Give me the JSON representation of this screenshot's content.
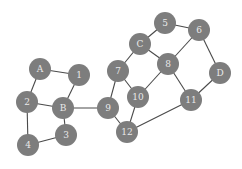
{
  "graph": {
    "node_radius": 11,
    "node_color": "#7d7d7d",
    "edge_color": "#4a4a4a",
    "label_color": "#e9e9e9",
    "nodes": [
      {
        "id": "A",
        "label": "A",
        "x": 40,
        "y": 69
      },
      {
        "id": "1",
        "label": "1",
        "x": 79,
        "y": 75
      },
      {
        "id": "2",
        "label": "2",
        "x": 27,
        "y": 102
      },
      {
        "id": "B",
        "label": "B",
        "x": 63,
        "y": 108
      },
      {
        "id": "3",
        "label": "3",
        "x": 66,
        "y": 135
      },
      {
        "id": "4",
        "label": "4",
        "x": 28,
        "y": 145
      },
      {
        "id": "7",
        "label": "7",
        "x": 118,
        "y": 71
      },
      {
        "id": "9",
        "label": "9",
        "x": 108,
        "y": 108
      },
      {
        "id": "10",
        "label": "10",
        "x": 138,
        "y": 97
      },
      {
        "id": "12",
        "label": "12",
        "x": 127,
        "y": 132
      },
      {
        "id": "C",
        "label": "C",
        "x": 140,
        "y": 44
      },
      {
        "id": "5",
        "label": "5",
        "x": 165,
        "y": 23
      },
      {
        "id": "6",
        "label": "6",
        "x": 199,
        "y": 30
      },
      {
        "id": "8",
        "label": "8",
        "x": 168,
        "y": 64
      },
      {
        "id": "D",
        "label": "D",
        "x": 220,
        "y": 73
      },
      {
        "id": "11",
        "label": "11",
        "x": 191,
        "y": 100
      }
    ],
    "edges": [
      [
        "A",
        "1"
      ],
      [
        "A",
        "2"
      ],
      [
        "2",
        "B"
      ],
      [
        "1",
        "B"
      ],
      [
        "2",
        "4"
      ],
      [
        "B",
        "3"
      ],
      [
        "3",
        "4"
      ],
      [
        "B",
        "9"
      ],
      [
        "9",
        "7"
      ],
      [
        "9",
        "12"
      ],
      [
        "7",
        "C"
      ],
      [
        "7",
        "10"
      ],
      [
        "10",
        "12"
      ],
      [
        "10",
        "8"
      ],
      [
        "C",
        "5"
      ],
      [
        "C",
        "8"
      ],
      [
        "5",
        "6"
      ],
      [
        "6",
        "8"
      ],
      [
        "6",
        "D"
      ],
      [
        "D",
        "11"
      ],
      [
        "8",
        "11"
      ],
      [
        "11",
        "12"
      ]
    ]
  }
}
